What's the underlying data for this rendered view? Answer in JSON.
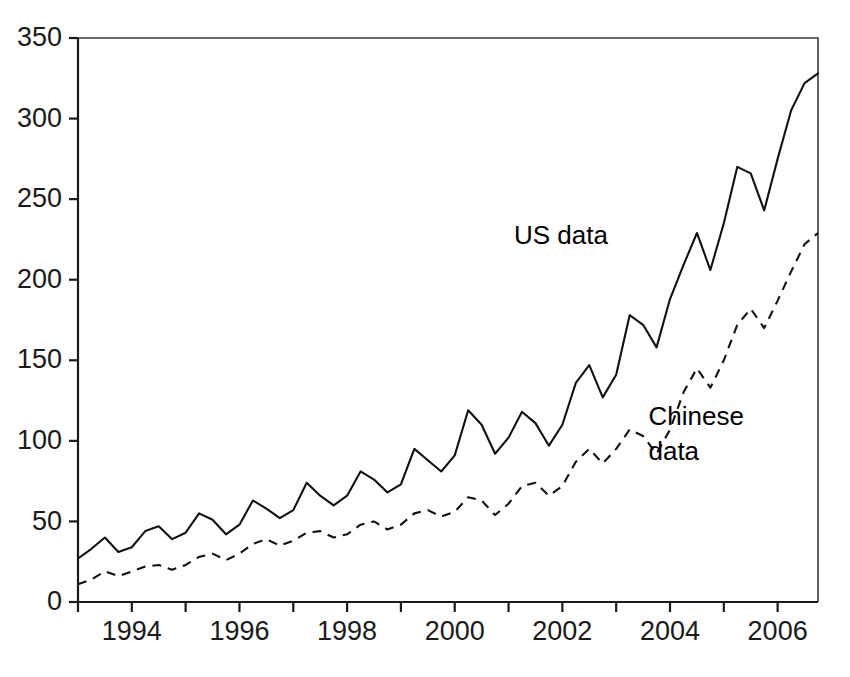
{
  "chart_data": {
    "type": "line",
    "title": "",
    "xlabel": "",
    "ylabel": "",
    "xlim": [
      1993.0,
      2006.75
    ],
    "ylim": [
      0,
      350
    ],
    "yticks": [
      0,
      50,
      100,
      150,
      200,
      250,
      300,
      350
    ],
    "ytick_labels": [
      "0",
      "50",
      "100",
      "150",
      "200",
      "250",
      "300",
      "350"
    ],
    "xticks": [
      1993,
      1994,
      1995,
      1996,
      1997,
      1998,
      1999,
      2000,
      2001,
      2002,
      2003,
      2004,
      2005,
      2006
    ],
    "xtick_labels": [
      "",
      "1994",
      "",
      "1996",
      "",
      "1998",
      "",
      "2000",
      "",
      "2002",
      "",
      "2004",
      "",
      "2006"
    ],
    "grid": false,
    "legend_position": "inline-annotation",
    "frequency": "quarterly",
    "x": [
      1993.0,
      1993.25,
      1993.5,
      1993.75,
      1994.0,
      1994.25,
      1994.5,
      1994.75,
      1995.0,
      1995.25,
      1995.5,
      1995.75,
      1996.0,
      1996.25,
      1996.5,
      1996.75,
      1997.0,
      1997.25,
      1997.5,
      1997.75,
      1998.0,
      1998.25,
      1998.5,
      1998.75,
      1999.0,
      1999.25,
      1999.5,
      1999.75,
      2000.0,
      2000.25,
      2000.5,
      2000.75,
      2001.0,
      2001.25,
      2001.5,
      2001.75,
      2002.0,
      2002.25,
      2002.5,
      2002.75,
      2003.0,
      2003.25,
      2003.5,
      2003.75,
      2004.0,
      2004.25,
      2004.5,
      2004.75,
      2005.0,
      2005.25,
      2005.5,
      2005.75,
      2006.0,
      2006.25,
      2006.5,
      2006.75
    ],
    "series": [
      {
        "name": "US data",
        "style": "solid",
        "color": "#111111",
        "values": [
          27,
          33,
          40,
          31,
          34,
          44,
          47,
          39,
          43,
          55,
          51,
          42,
          48,
          63,
          58,
          52,
          57,
          74,
          66,
          60,
          66,
          81,
          76,
          68,
          73,
          95,
          88,
          81,
          91,
          119,
          110,
          92,
          102,
          118,
          111,
          97,
          110,
          136,
          147,
          127,
          141,
          178,
          172,
          158,
          188,
          209,
          229,
          206,
          235,
          270,
          266,
          243,
          275,
          305,
          322,
          328
        ]
      },
      {
        "name": "Chinese data",
        "style": "dashed",
        "color": "#111111",
        "values": [
          11,
          14,
          19,
          16,
          19,
          22,
          23,
          20,
          23,
          28,
          30,
          26,
          30,
          36,
          39,
          35,
          38,
          43,
          44,
          40,
          42,
          48,
          50,
          45,
          48,
          55,
          57,
          53,
          56,
          65,
          63,
          54,
          61,
          72,
          74,
          66,
          72,
          87,
          95,
          86,
          95,
          107,
          103,
          92,
          107,
          130,
          145,
          133,
          150,
          172,
          182,
          170,
          187,
          205,
          222,
          229
        ]
      }
    ],
    "annotations": [
      {
        "name": "us-data-label",
        "text": "US data",
        "x": 2001.1,
        "y": 222
      },
      {
        "name": "chinese-data-label-line1",
        "text": "Chinese",
        "x": 2003.6,
        "y": 110
      },
      {
        "name": "chinese-data-label-line2",
        "text": "data",
        "x": 2003.6,
        "y": 88
      }
    ]
  }
}
